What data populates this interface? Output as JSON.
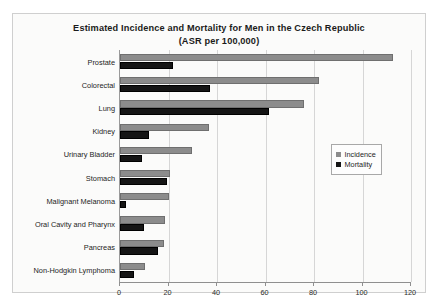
{
  "chart_data": {
    "type": "bar",
    "orientation": "horizontal",
    "title": "Estimated  Incidence and Mortality for Men in the Czech Republic (ASR per 100,000)",
    "title_line1": "Estimated  Incidence and Mortality for Men in the Czech Republic",
    "title_line2": "(ASR per 100,000)",
    "xlabel": "",
    "ylabel": "",
    "xlim": [
      0,
      120
    ],
    "xticks": [
      0,
      20,
      40,
      60,
      80,
      100,
      120
    ],
    "grid": true,
    "legend_position": "right-middle",
    "categories": [
      "Prostate",
      "Colorectal",
      "Lung",
      "Kidney",
      "Urinary Bladder",
      "Stomach",
      "Malignant Melanoma",
      "Oral Cavity and Pharynx",
      "Pancreas",
      "Non-Hodgkin Lymphoma"
    ],
    "series": [
      {
        "name": "Incidence",
        "color": "#8c8c8c",
        "values": [
          112.6,
          82.0,
          76.0,
          36.5,
          29.7,
          20.6,
          20.0,
          18.5,
          18.0,
          10.3
        ]
      },
      {
        "name": "Mortality",
        "color": "#151515",
        "values": [
          22.0,
          37.0,
          61.5,
          12.0,
          9.0,
          19.4,
          2.5,
          10.0,
          15.7,
          5.8
        ]
      }
    ]
  }
}
